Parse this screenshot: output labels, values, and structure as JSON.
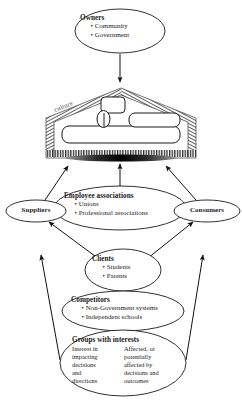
{
  "figure": {
    "kind": "stakeholder-environment-diagram",
    "background_color": "#ffffff",
    "line_color": "#1a1a1a",
    "hatch_color": "#2b2b2b"
  },
  "nodes": {
    "owners": {
      "title": "Owners",
      "items": [
        "Community",
        "Government"
      ],
      "shape": "ellipse"
    },
    "employee_associations": {
      "title": "Employee associations",
      "items": [
        "Unions",
        "Professional associations"
      ],
      "shape": "ellipse"
    },
    "clients": {
      "title": "Clients",
      "items": [
        "Students",
        "Parents"
      ],
      "shape": "ellipse"
    },
    "competitors": {
      "title": "Competitors",
      "items": [
        "Non-Government systems",
        "Independent schools"
      ],
      "shape": "ellipse"
    },
    "groups_with_interests": {
      "title": "Groups with interests",
      "shape": "ellipse",
      "columns": [
        {
          "lines": [
            "Interest in",
            "impacting",
            "decisions",
            "and",
            "directions"
          ]
        },
        {
          "lines": [
            "Affected, or",
            "potentially",
            "affected by",
            "decisions and",
            "outcomes"
          ]
        }
      ]
    },
    "suppliers": {
      "label": "Suppliers",
      "shape": "ellipse"
    },
    "consumers": {
      "label": "Consumers",
      "shape": "ellipse"
    },
    "culture_container": {
      "label": "culture",
      "shape": "hatched-pentagon",
      "description": "organisation enclosed by culture boundary"
    }
  },
  "connections": [
    {
      "from": "owners",
      "to": "culture_container",
      "style": "arrow"
    },
    {
      "from": "suppliers",
      "to": "culture_container",
      "style": "arrow"
    },
    {
      "from": "employee_associations",
      "to": "culture_container",
      "style": "arrow"
    },
    {
      "from": "consumers",
      "to": "culture_container",
      "style": "arrow"
    },
    {
      "from": "clients",
      "to": "suppliers",
      "style": "arrow"
    },
    {
      "from": "clients",
      "to": "consumers",
      "style": "arrow"
    },
    {
      "from": "groups_with_interests",
      "to": "suppliers",
      "style": "arrow"
    },
    {
      "from": "groups_with_interests",
      "to": "consumers",
      "style": "arrow"
    }
  ]
}
